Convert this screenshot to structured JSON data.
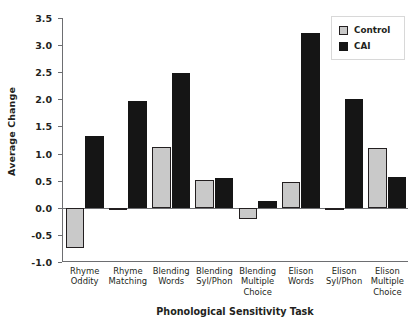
{
  "chart_data": {
    "type": "bar",
    "title": "",
    "xlabel": "Phonological Sensitivity Task",
    "ylabel": "Average Change",
    "ylim": [
      -1.0,
      3.5
    ],
    "yticks": [
      "3.5",
      "3.0",
      "2.5",
      "2.0",
      "1.5",
      "1.0",
      "0.5",
      "0.0",
      "-0.5",
      "-1.0"
    ],
    "ytick_values": [
      3.5,
      3.0,
      2.5,
      2.0,
      1.5,
      1.0,
      0.5,
      0.0,
      -0.5,
      -1.0
    ],
    "grid": false,
    "legend_position": "top-right",
    "categories": [
      "Rhyme Oddity",
      "Rhyme Matching",
      "Blending Words",
      "Blending Syl/Phon",
      "Blending Multiple Choice",
      "Elison Words",
      "Elison Syl/Phon",
      "Elison Multiple Choice"
    ],
    "category_lines": [
      [
        "Rhyme",
        "Oddity"
      ],
      [
        "Rhyme",
        "Matching"
      ],
      [
        "Blending",
        "Words"
      ],
      [
        "Blending",
        "Syl/Phon"
      ],
      [
        "Blending",
        "Multiple",
        "Choice"
      ],
      [
        "Elison",
        "Words"
      ],
      [
        "Elison",
        "Syl/Phon"
      ],
      [
        "Elison",
        "Multiple",
        "Choice"
      ]
    ],
    "series": [
      {
        "name": "Control",
        "color": "#c9c9c9",
        "values": [
          -0.75,
          -0.04,
          1.12,
          0.52,
          -0.21,
          0.47,
          -0.05,
          1.1
        ]
      },
      {
        "name": "CAI",
        "color": "#151515",
        "values": [
          1.32,
          1.97,
          2.48,
          0.55,
          0.12,
          3.22,
          2.0,
          0.57
        ]
      }
    ]
  },
  "legend": {
    "items": [
      {
        "label": "Control",
        "swatch": "control-swatch"
      },
      {
        "label": "CAI",
        "swatch": "cai-swatch"
      }
    ]
  }
}
